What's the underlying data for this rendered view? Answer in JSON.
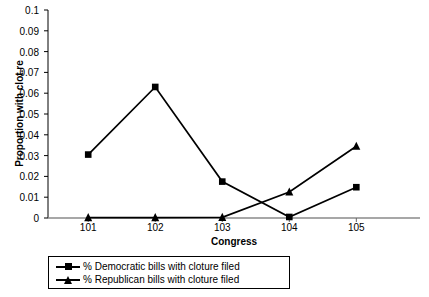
{
  "chart_data": {
    "type": "line",
    "title": "",
    "xlabel": "Congress",
    "ylabel": "Proportion with clot.re",
    "categories": [
      "101",
      "102",
      "103",
      "104",
      "105"
    ],
    "ylim": [
      0,
      0.1
    ],
    "y_ticks": [
      "0",
      "0.01",
      "0.02",
      "0.03",
      "0.04",
      "0.05",
      "0.06",
      "0.07",
      "0.08",
      "0.09",
      "0.1"
    ],
    "y_tick_values": [
      0,
      0.01,
      0.02,
      0.03,
      0.04,
      0.05,
      0.06,
      0.07,
      0.08,
      0.09,
      0.1
    ],
    "grid": false,
    "legend_position": "below",
    "series": [
      {
        "name": "% Democratic bills with cloture filed",
        "marker": "square",
        "color": "#000000",
        "values": [
          0.0305,
          0.063,
          0.0175,
          0.0005,
          0.0148
        ]
      },
      {
        "name": "% Republican bills with cloture filed",
        "marker": "triangle",
        "color": "#000000",
        "values": [
          0.0002,
          0.0002,
          0.0003,
          0.0125,
          0.0345
        ]
      }
    ]
  },
  "legend": {
    "items": [
      {
        "label": "% Democratic bills with cloture filed",
        "marker": "square"
      },
      {
        "label": "% Republican bills with cloture filed",
        "marker": "triangle"
      }
    ]
  }
}
